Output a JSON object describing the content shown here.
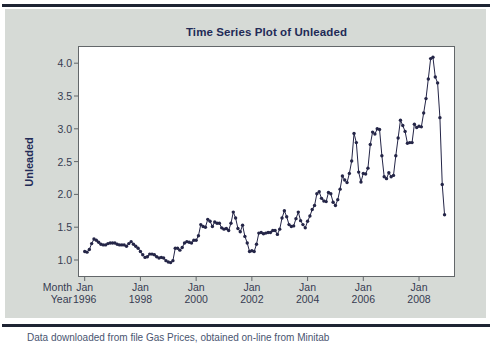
{
  "page": {
    "caption": "Data downloaded from file Gas Prices, obtained on-line from Minitab"
  },
  "chart": {
    "title": "Time Series Plot of Unleaded",
    "y_axis_title": "Unleaded",
    "axis_row_labels": {
      "month": "Month",
      "year": "Year"
    },
    "colors": {
      "rule": "#1e2433",
      "panel_bg": "#d6dad6",
      "plot_bg": "#ffffff",
      "frame": "#63676a",
      "series": "#242547",
      "title_text": "#222a56",
      "tick_text": "#363c52"
    }
  },
  "chart_data": {
    "type": "line",
    "title": "Time Series Plot of Unleaded",
    "xlabel": "Month / Year",
    "ylabel": "Unleaded",
    "frequency": "monthly",
    "x_start": "Jan 1996",
    "x_end": "Dec 2008",
    "ylim": [
      0.74,
      4.26
    ],
    "yticks": [
      1.0,
      1.5,
      2.0,
      2.5,
      3.0,
      3.5,
      4.0
    ],
    "xticks": [
      {
        "month": "Jan",
        "year": "1996"
      },
      {
        "month": "Jan",
        "year": "1998"
      },
      {
        "month": "Jan",
        "year": "2000"
      },
      {
        "month": "Jan",
        "year": "2002"
      },
      {
        "month": "Jan",
        "year": "2004"
      },
      {
        "month": "Jan",
        "year": "2006"
      },
      {
        "month": "Jan",
        "year": "2008"
      }
    ],
    "xtick_month_interval": 24,
    "grid": false,
    "legend": false,
    "series": [
      {
        "name": "Unleaded",
        "values": [
          1.13,
          1.12,
          1.16,
          1.25,
          1.32,
          1.3,
          1.27,
          1.24,
          1.23,
          1.23,
          1.25,
          1.26,
          1.26,
          1.26,
          1.24,
          1.23,
          1.23,
          1.23,
          1.21,
          1.25,
          1.28,
          1.24,
          1.21,
          1.18,
          1.13,
          1.08,
          1.04,
          1.05,
          1.09,
          1.09,
          1.08,
          1.05,
          1.03,
          1.04,
          1.03,
          0.99,
          0.97,
          0.96,
          0.99,
          1.18,
          1.18,
          1.15,
          1.19,
          1.26,
          1.28,
          1.27,
          1.26,
          1.3,
          1.3,
          1.37,
          1.54,
          1.51,
          1.5,
          1.62,
          1.59,
          1.51,
          1.58,
          1.56,
          1.56,
          1.49,
          1.47,
          1.48,
          1.45,
          1.56,
          1.73,
          1.64,
          1.48,
          1.43,
          1.53,
          1.36,
          1.26,
          1.13,
          1.14,
          1.13,
          1.24,
          1.41,
          1.42,
          1.4,
          1.41,
          1.42,
          1.42,
          1.45,
          1.45,
          1.39,
          1.47,
          1.64,
          1.75,
          1.66,
          1.54,
          1.51,
          1.52,
          1.63,
          1.73,
          1.6,
          1.54,
          1.49,
          1.59,
          1.67,
          1.77,
          1.83,
          2.01,
          2.04,
          1.94,
          1.9,
          1.89,
          2.03,
          2.01,
          1.88,
          1.83,
          1.92,
          2.08,
          2.28,
          2.22,
          2.18,
          2.32,
          2.51,
          2.93,
          2.79,
          2.34,
          2.19,
          2.32,
          2.31,
          2.4,
          2.76,
          2.95,
          2.92,
          3.0,
          2.99,
          2.59,
          2.27,
          2.24,
          2.33,
          2.27,
          2.29,
          2.59,
          2.86,
          3.13,
          3.05,
          2.96,
          2.78,
          2.79,
          2.79,
          3.07,
          3.02,
          3.04,
          3.03,
          3.24,
          3.46,
          3.76,
          4.07,
          4.09,
          3.79,
          3.7,
          3.17,
          2.15,
          1.69
        ]
      }
    ]
  }
}
